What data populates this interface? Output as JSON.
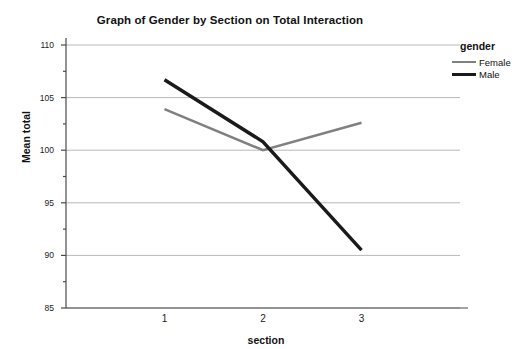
{
  "chart_data": {
    "type": "line",
    "title": "Graph of Gender by Section on Total Interaction",
    "xlabel": "section",
    "ylabel": "Mean total",
    "categories": [
      "1",
      "2",
      "3"
    ],
    "x": [
      1,
      2,
      3
    ],
    "ylim": [
      85,
      110
    ],
    "yticks": [
      85,
      90,
      95,
      100,
      105,
      110
    ],
    "ytick_labels": [
      "85",
      "90",
      "95",
      "100",
      "105",
      "110"
    ],
    "yminor_ticks": [
      87.5,
      92.5,
      97.5,
      102.5,
      107.5
    ],
    "grid": true,
    "grid_axis": "y",
    "legend": {
      "title": "gender",
      "position": "right",
      "entries": [
        "Female",
        "Male"
      ]
    },
    "series": [
      {
        "name": "Female",
        "color": "#808080",
        "width": 2.6,
        "values": [
          103.9,
          100.0,
          102.6
        ]
      },
      {
        "name": "Male",
        "color": "#1a1a1a",
        "width": 3.4,
        "values": [
          106.7,
          100.8,
          90.5
        ]
      }
    ]
  },
  "colors": {
    "female": "#808080",
    "male": "#1a1a1a",
    "grid": "#b8b8b8",
    "axis": "#4a4a4a",
    "background": "#ffffff"
  }
}
